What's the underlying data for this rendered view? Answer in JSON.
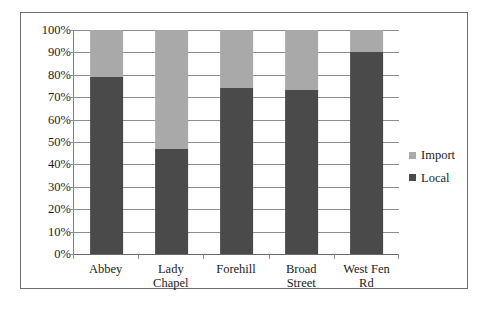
{
  "chart_data": {
    "type": "bar",
    "subtype": "100% stacked bar",
    "title": "",
    "xlabel": "",
    "ylabel": "",
    "categories": [
      "Abbey",
      "Lady Chapel",
      "Forehill",
      "Broad Street",
      "West Fen Rd"
    ],
    "category_lines": [
      [
        "Abbey"
      ],
      [
        "Lady",
        "Chapel"
      ],
      [
        "Forehill"
      ],
      [
        "Broad",
        "Street"
      ],
      [
        "West Fen",
        "Rd"
      ]
    ],
    "series": [
      {
        "name": "Local",
        "color": "#4a4a4a",
        "values": [
          79,
          47,
          74,
          73,
          90
        ]
      },
      {
        "name": "Import",
        "color": "#a9a9a9",
        "values": [
          21,
          53,
          26,
          27,
          10
        ]
      }
    ],
    "stack_order_top_to_bottom": [
      "Import",
      "Local"
    ],
    "ylim": [
      0,
      100
    ],
    "ytick_values": [
      100,
      90,
      80,
      70,
      60,
      50,
      40,
      30,
      20,
      10,
      0
    ],
    "ytick_labels": [
      "100%",
      "90%",
      "80%",
      "70%",
      "60%",
      "50%",
      "40%",
      "30%",
      "20%",
      "10%",
      "0%"
    ],
    "grid": true,
    "grid_axis": "y",
    "legend_position": "right",
    "legend": [
      {
        "label": "Import",
        "color": "#a9a9a9"
      },
      {
        "label": "Local",
        "color": "#4a4a4a"
      }
    ]
  },
  "colors": {
    "local": "#4a4a4a",
    "import": "#a9a9a9",
    "gridline": "#8d8d8d",
    "axis": "#6a6a6a",
    "frame_border": "#6e6e6e",
    "text": "#1c1c1c",
    "background": "#ffffff"
  }
}
